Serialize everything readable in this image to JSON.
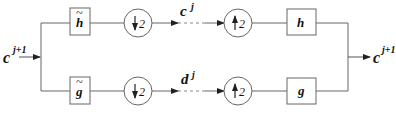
{
  "diagram": {
    "type": "two-channel filter bank (wavelet analysis/synthesis)",
    "input": {
      "label": "c",
      "sup": "j+1"
    },
    "output": {
      "label": "c",
      "sup": "j+1"
    },
    "analysis": {
      "top_filter": {
        "label": "h",
        "accent": "~"
      },
      "bottom_filter": {
        "label": "g",
        "accent": "~"
      },
      "downsample_top": {
        "arrow": "↓",
        "factor": "2"
      },
      "downsample_bottom": {
        "arrow": "↓",
        "factor": "2"
      }
    },
    "coefficients": {
      "top": {
        "label": "c",
        "sup": "j"
      },
      "bottom": {
        "label": "d",
        "sup": "j"
      }
    },
    "synthesis": {
      "upsample_top": {
        "arrow": "↑",
        "factor": "2"
      },
      "upsample_bottom": {
        "arrow": "↑",
        "factor": "2"
      },
      "top_filter": {
        "label": "h"
      },
      "bottom_filter": {
        "label": "g"
      }
    },
    "colors": {
      "line": "#555555",
      "text": "#111111",
      "background": "#ffffff"
    }
  }
}
